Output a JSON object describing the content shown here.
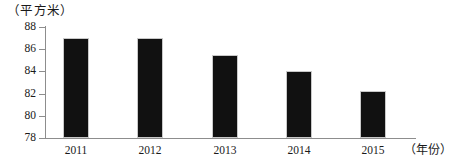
{
  "chart_data": {
    "type": "bar",
    "title": "",
    "subtitle": "",
    "unit_label": "（平方米）",
    "xlabel": "（年份）",
    "ylabel": "",
    "categories": [
      "2011",
      "2012",
      "2013",
      "2014",
      "2015"
    ],
    "values": [
      87.0,
      87.0,
      85.5,
      84.0,
      82.2
    ],
    "series": [
      {
        "name": "人均住房面积",
        "values": [
          87.0,
          87.0,
          85.5,
          84.0,
          82.2
        ]
      }
    ],
    "ylim": [
      78,
      88
    ],
    "ytick_values": [
      88,
      86,
      84,
      82,
      80,
      78
    ],
    "ytick_labels": [
      "88",
      "86",
      "84",
      "82",
      "80",
      "78"
    ],
    "ytick_step": 2,
    "grid": false,
    "legend": false,
    "legend_position": "none",
    "bar_color": "#111111",
    "axis_color": "#8d8d8d",
    "annotations": []
  },
  "figure": {
    "background": "#ffffff",
    "text_color": "#1a1a1a"
  }
}
